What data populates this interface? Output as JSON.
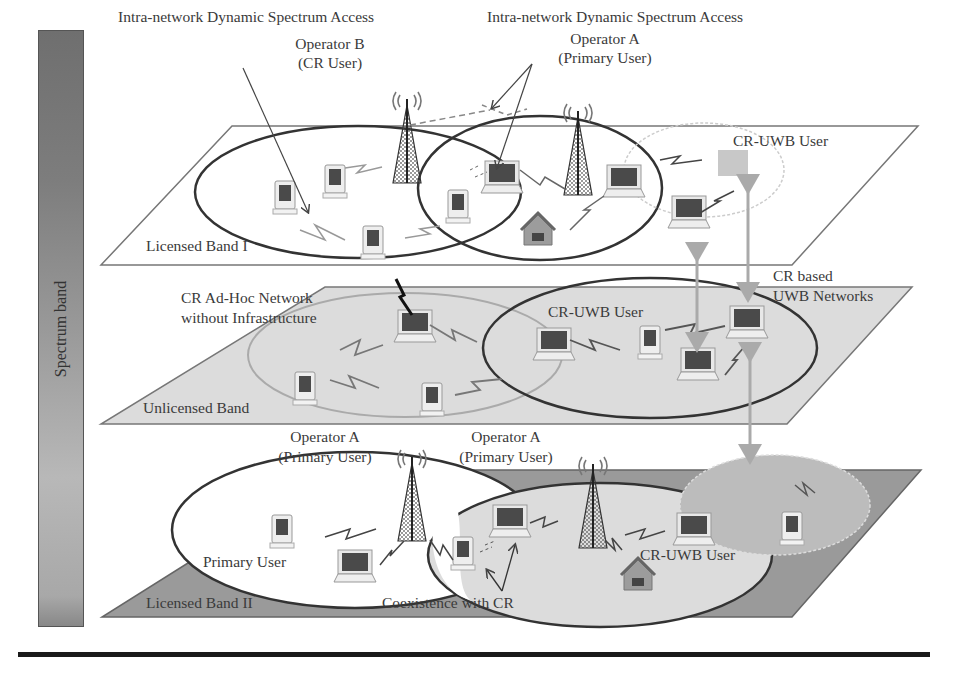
{
  "figure": {
    "side_bar": {
      "label": "Spectrum band"
    },
    "top_labels": {
      "dsa_left": "Intra-network Dynamic Spectrum Access",
      "dsa_right": "Intra-network Dynamic Spectrum Access",
      "operator_b": {
        "name": "Operator B",
        "role": "(CR User)"
      },
      "operator_a_top": {
        "name": "Operator A",
        "role": "(Primary User)"
      },
      "cr_uwb_user_top": "CR-UWB User"
    },
    "planes": [
      {
        "id": "licensed-band-1",
        "label": "Licensed Band I",
        "fill": "#ffffff"
      },
      {
        "id": "unlicensed-band",
        "label": "Unlicensed Band",
        "fill": "#dcdcdc"
      },
      {
        "id": "licensed-band-2",
        "label": "Licensed Band II",
        "fill": "#9a9a9a"
      }
    ],
    "middle_labels": {
      "adhoc_line1": "CR Ad-Hoc Network",
      "adhoc_line2": "without Infrastructure",
      "cr_uwb_user_mid": "CR-UWB User",
      "cr_based_line1": "CR based",
      "cr_based_line2": "UWB Networks"
    },
    "bottom_labels": {
      "operator_a_left": {
        "name": "Operator A",
        "role": "(Primary User)"
      },
      "operator_a_right": {
        "name": "Operator A",
        "role": "(Primary User)"
      },
      "primary_user": "Primary User",
      "coexistence": "Coexistence with CR",
      "cr_uwb_user_bottom": "CR-UWB User"
    }
  }
}
